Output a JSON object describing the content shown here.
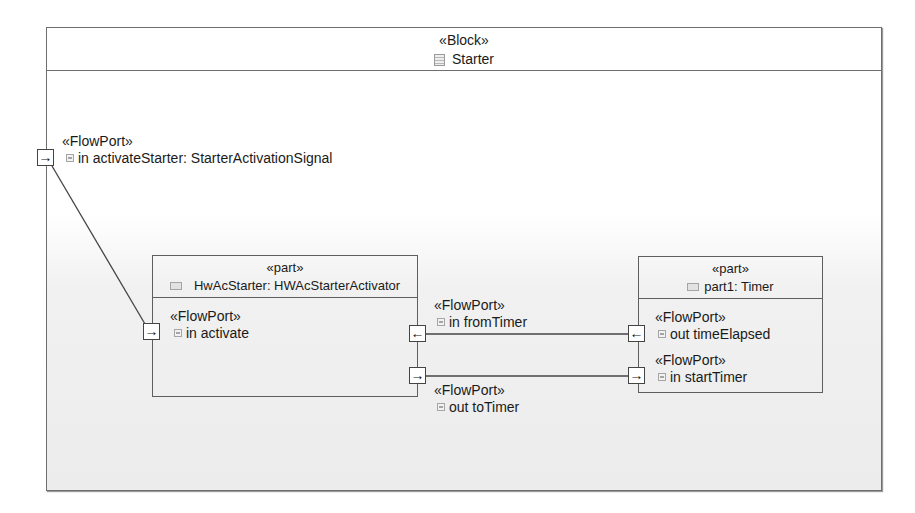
{
  "block": {
    "stereotype": "«Block»",
    "name": "Starter",
    "icon": "block-icon"
  },
  "external_port": {
    "stereotype": "«FlowPort»",
    "name": "in activateStarter: StarterActivationSignal",
    "direction_glyph": "→"
  },
  "parts": [
    {
      "stereotype": "«part»",
      "name": "HwAcStarter: HWAcStarterActivator",
      "icon": "part-icon",
      "ports": [
        {
          "stereotype": "«FlowPort»",
          "name": "in activate",
          "direction_glyph": "→"
        },
        {
          "stereotype": "«FlowPort»",
          "name": "in fromTimer",
          "direction_glyph": "←"
        },
        {
          "stereotype": "«FlowPort»",
          "name": "out toTimer",
          "direction_glyph": "→"
        }
      ]
    },
    {
      "stereotype": "«part»",
      "name": "part1: Timer",
      "icon": "part-icon",
      "ports": [
        {
          "stereotype": "«FlowPort»",
          "name": "out timeElapsed",
          "direction_glyph": "←"
        },
        {
          "stereotype": "«FlowPort»",
          "name": "in startTimer",
          "direction_glyph": "→"
        }
      ]
    }
  ],
  "connectors": [
    {
      "from": "in activateStarter",
      "to": "in activate"
    },
    {
      "from": "out timeElapsed",
      "to": "in fromTimer"
    },
    {
      "from": "out toTimer",
      "to": "in startTimer"
    }
  ],
  "colors": {
    "frame_border": "#6e6e6e",
    "part_border": "#5e5e5e",
    "connector": "#444444",
    "background_bottom": "#ececec"
  }
}
